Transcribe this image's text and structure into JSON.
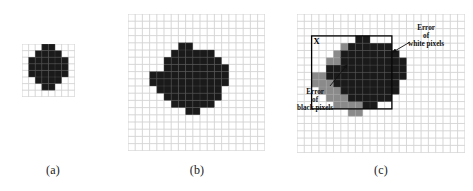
{
  "figure": {
    "background_color": "#ffffff",
    "grid_line_color": "#c9c9c9",
    "cell_black_color": "#1a1a1a",
    "cell_gray_color": "#8a8a8a",
    "annotation_color": "#111111",
    "box_color": "#000000"
  },
  "panels": [
    {
      "id": "a",
      "caption": "(a)",
      "x": 22,
      "y": 44,
      "cols": 8,
      "rows": 8,
      "cell": 6.6,
      "description": "coarse digitization of a disk on an 8 by 8 grid",
      "black_cells": [
        [
          3,
          0
        ],
        [
          4,
          0
        ],
        [
          2,
          1
        ],
        [
          3,
          1
        ],
        [
          4,
          1
        ],
        [
          5,
          1
        ],
        [
          1,
          2
        ],
        [
          2,
          2
        ],
        [
          3,
          2
        ],
        [
          4,
          2
        ],
        [
          5,
          2
        ],
        [
          6,
          2
        ],
        [
          1,
          3
        ],
        [
          2,
          3
        ],
        [
          3,
          3
        ],
        [
          4,
          3
        ],
        [
          5,
          3
        ],
        [
          6,
          3
        ],
        [
          1,
          4
        ],
        [
          2,
          4
        ],
        [
          3,
          4
        ],
        [
          4,
          4
        ],
        [
          5,
          4
        ],
        [
          6,
          4
        ],
        [
          2,
          5
        ],
        [
          3,
          5
        ],
        [
          4,
          5
        ],
        [
          5,
          5
        ],
        [
          3,
          6
        ],
        [
          4,
          6
        ]
      ]
    },
    {
      "id": "b",
      "caption": "(b)",
      "x": 128,
      "y": 14,
      "cols": 19,
      "rows": 19,
      "cell": 7.2,
      "description": "finer digitization of the same disk on a 19 by 19 grid",
      "black_cells": [
        [
          7,
          4
        ],
        [
          8,
          4
        ],
        [
          6,
          5
        ],
        [
          7,
          5
        ],
        [
          8,
          5
        ],
        [
          9,
          5
        ],
        [
          10,
          5
        ],
        [
          11,
          5
        ],
        [
          5,
          6
        ],
        [
          6,
          6
        ],
        [
          7,
          6
        ],
        [
          8,
          6
        ],
        [
          9,
          6
        ],
        [
          10,
          6
        ],
        [
          11,
          6
        ],
        [
          12,
          6
        ],
        [
          5,
          7
        ],
        [
          6,
          7
        ],
        [
          7,
          7
        ],
        [
          8,
          7
        ],
        [
          9,
          7
        ],
        [
          10,
          7
        ],
        [
          11,
          7
        ],
        [
          12,
          7
        ],
        [
          13,
          7
        ],
        [
          3,
          8
        ],
        [
          4,
          8
        ],
        [
          5,
          8
        ],
        [
          6,
          8
        ],
        [
          7,
          8
        ],
        [
          8,
          8
        ],
        [
          9,
          8
        ],
        [
          10,
          8
        ],
        [
          11,
          8
        ],
        [
          12,
          8
        ],
        [
          13,
          8
        ],
        [
          3,
          9
        ],
        [
          4,
          9
        ],
        [
          5,
          9
        ],
        [
          6,
          9
        ],
        [
          7,
          9
        ],
        [
          8,
          9
        ],
        [
          9,
          9
        ],
        [
          10,
          9
        ],
        [
          11,
          9
        ],
        [
          12,
          9
        ],
        [
          13,
          9
        ],
        [
          4,
          10
        ],
        [
          5,
          10
        ],
        [
          6,
          10
        ],
        [
          7,
          10
        ],
        [
          8,
          10
        ],
        [
          9,
          10
        ],
        [
          10,
          10
        ],
        [
          11,
          10
        ],
        [
          12,
          10
        ],
        [
          5,
          11
        ],
        [
          6,
          11
        ],
        [
          7,
          11
        ],
        [
          8,
          11
        ],
        [
          9,
          11
        ],
        [
          10,
          11
        ],
        [
          11,
          11
        ],
        [
          12,
          11
        ],
        [
          6,
          12
        ],
        [
          7,
          12
        ],
        [
          8,
          12
        ],
        [
          9,
          12
        ],
        [
          10,
          12
        ],
        [
          11,
          12
        ],
        [
          8,
          13
        ],
        [
          9,
          13
        ]
      ]
    },
    {
      "id": "c",
      "caption": "(c)",
      "x": 297,
      "y": 14,
      "cols": 23,
      "rows": 19,
      "cell": 7.3,
      "description": "two digitizations superimposed showing error of black pixels and error of white pixels",
      "gray_cells": [
        [
          6,
          4
        ],
        [
          7,
          4
        ],
        [
          5,
          5
        ],
        [
          6,
          5
        ],
        [
          7,
          5
        ],
        [
          8,
          5
        ],
        [
          9,
          5
        ],
        [
          10,
          5
        ],
        [
          4,
          6
        ],
        [
          5,
          6
        ],
        [
          6,
          6
        ],
        [
          7,
          6
        ],
        [
          8,
          6
        ],
        [
          9,
          6
        ],
        [
          10,
          6
        ],
        [
          11,
          6
        ],
        [
          4,
          7
        ],
        [
          5,
          7
        ],
        [
          6,
          7
        ],
        [
          7,
          7
        ],
        [
          8,
          7
        ],
        [
          9,
          7
        ],
        [
          10,
          7
        ],
        [
          11,
          7
        ],
        [
          12,
          7
        ],
        [
          2,
          8
        ],
        [
          3,
          8
        ],
        [
          4,
          8
        ],
        [
          5,
          8
        ],
        [
          6,
          8
        ],
        [
          7,
          8
        ],
        [
          8,
          8
        ],
        [
          9,
          8
        ],
        [
          10,
          8
        ],
        [
          11,
          8
        ],
        [
          12,
          8
        ],
        [
          2,
          9
        ],
        [
          3,
          9
        ],
        [
          4,
          9
        ],
        [
          5,
          9
        ],
        [
          6,
          9
        ],
        [
          7,
          9
        ],
        [
          8,
          9
        ],
        [
          9,
          9
        ],
        [
          10,
          9
        ],
        [
          11,
          9
        ],
        [
          12,
          9
        ],
        [
          3,
          10
        ],
        [
          4,
          10
        ],
        [
          5,
          10
        ],
        [
          6,
          10
        ],
        [
          7,
          10
        ],
        [
          8,
          10
        ],
        [
          9,
          10
        ],
        [
          10,
          10
        ],
        [
          11,
          10
        ],
        [
          4,
          11
        ],
        [
          5,
          11
        ],
        [
          6,
          11
        ],
        [
          7,
          11
        ],
        [
          8,
          11
        ],
        [
          9,
          11
        ],
        [
          10,
          11
        ],
        [
          11,
          11
        ],
        [
          5,
          12
        ],
        [
          6,
          12
        ],
        [
          7,
          12
        ],
        [
          8,
          12
        ],
        [
          9,
          12
        ],
        [
          10,
          12
        ],
        [
          7,
          13
        ],
        [
          8,
          13
        ]
      ],
      "black_cells": [
        [
          8,
          3
        ],
        [
          9,
          3
        ],
        [
          7,
          4
        ],
        [
          8,
          4
        ],
        [
          9,
          4
        ],
        [
          10,
          4
        ],
        [
          11,
          4
        ],
        [
          12,
          4
        ],
        [
          6,
          5
        ],
        [
          7,
          5
        ],
        [
          8,
          5
        ],
        [
          9,
          5
        ],
        [
          10,
          5
        ],
        [
          11,
          5
        ],
        [
          12,
          5
        ],
        [
          13,
          5
        ],
        [
          6,
          6
        ],
        [
          7,
          6
        ],
        [
          8,
          6
        ],
        [
          9,
          6
        ],
        [
          10,
          6
        ],
        [
          11,
          6
        ],
        [
          12,
          6
        ],
        [
          13,
          6
        ],
        [
          14,
          6
        ],
        [
          4,
          7
        ],
        [
          5,
          7
        ],
        [
          6,
          7
        ],
        [
          7,
          7
        ],
        [
          8,
          7
        ],
        [
          9,
          7
        ],
        [
          10,
          7
        ],
        [
          11,
          7
        ],
        [
          12,
          7
        ],
        [
          13,
          7
        ],
        [
          14,
          7
        ],
        [
          4,
          8
        ],
        [
          5,
          8
        ],
        [
          6,
          8
        ],
        [
          7,
          8
        ],
        [
          8,
          8
        ],
        [
          9,
          8
        ],
        [
          10,
          8
        ],
        [
          11,
          8
        ],
        [
          12,
          8
        ],
        [
          13,
          8
        ],
        [
          14,
          8
        ],
        [
          5,
          9
        ],
        [
          6,
          9
        ],
        [
          7,
          9
        ],
        [
          8,
          9
        ],
        [
          9,
          9
        ],
        [
          10,
          9
        ],
        [
          11,
          9
        ],
        [
          12,
          9
        ],
        [
          13,
          9
        ],
        [
          6,
          10
        ],
        [
          7,
          10
        ],
        [
          8,
          10
        ],
        [
          9,
          10
        ],
        [
          10,
          10
        ],
        [
          11,
          10
        ],
        [
          12,
          10
        ],
        [
          13,
          10
        ],
        [
          7,
          11
        ],
        [
          8,
          11
        ],
        [
          9,
          11
        ],
        [
          10,
          11
        ],
        [
          11,
          11
        ],
        [
          12,
          11
        ],
        [
          9,
          12
        ],
        [
          10,
          12
        ]
      ],
      "reference_box": {
        "x": 2,
        "y": 3,
        "w": 11,
        "h": 10,
        "label": "X"
      },
      "annotations": [
        {
          "id": "error-white-pixels",
          "lines": [
            "Error",
            "of",
            "white pixels"
          ],
          "text_x": 408,
          "text_y": 24,
          "leader": {
            "x1": 410,
            "y1": 42,
            "x2": 393,
            "y2": 52
          }
        },
        {
          "id": "error-black-pixels",
          "lines": [
            "Error",
            "of",
            "black pixels"
          ],
          "text_x": 297,
          "text_y": 88,
          "leader": {
            "x1": 330,
            "y1": 86,
            "x2": 347,
            "y2": 65
          }
        }
      ]
    }
  ],
  "captions": {
    "a": {
      "label": "(a)",
      "x": 22,
      "y": 163,
      "w": 62
    },
    "b": {
      "label": "(b)",
      "x": 166,
      "y": 163,
      "w": 62
    },
    "c": {
      "label": "(c)",
      "x": 350,
      "y": 163,
      "w": 62
    }
  }
}
